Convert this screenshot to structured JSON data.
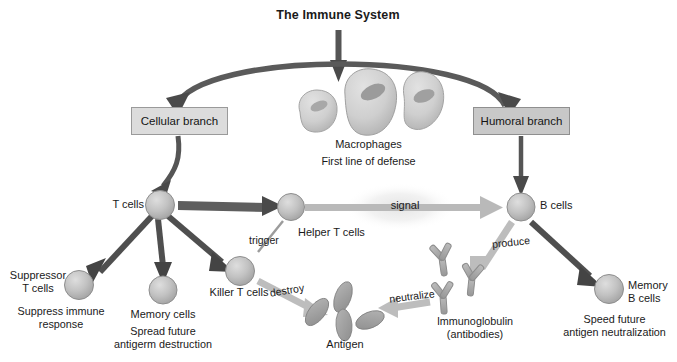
{
  "diagram": {
    "title": "The Immune System",
    "branches": {
      "cellular": "Cellular branch",
      "humoral": "Humoral branch"
    },
    "macrophages": {
      "name": "Macrophages",
      "caption": "First line of defense"
    },
    "cells": {
      "t_cells": "T cells",
      "helper_t_cells": "Helper T cells",
      "b_cells": "B cells",
      "suppressor_t_cells": "Suppressor\nT cells",
      "suppressor_caption": "Suppress immune\nresponse",
      "memory_cells": "Memory cells",
      "memory_caption": "Spread future\nantigerm destruction",
      "killer_t_cells": "Killer T cells",
      "memory_b_cells": "Memory\nB cells",
      "memory_b_caption": "Speed future\nantigen neutralization",
      "antigen": "Antigen",
      "immunoglobulin": "Immunoglobulin\n(antibodies)"
    },
    "verbs": {
      "trigger": "trigger",
      "signal": "signal",
      "destroy": "destroy",
      "neutralize": "neutralize",
      "produce": "produce"
    },
    "colors": {
      "background": "#ffffff",
      "text": "#1a1a1a",
      "cellular_box_fill": "#dcdcdc",
      "humoral_box_fill": "#c8c8c8",
      "box_border": "#9a9a9a",
      "dark_arrow": "#4d4d4d",
      "light_arrow": "#b9b9b9",
      "cell_fill": "#bdbdbd",
      "cell_edge": "#8e8e8e",
      "macrophage_fill": "#cfcfcf",
      "macrophage_nucleus": "#9b9b9b",
      "antigen_fill": "#9e9e9e",
      "antibody_fill": "#a8a8a8",
      "signal_glow": "#ededed"
    }
  }
}
